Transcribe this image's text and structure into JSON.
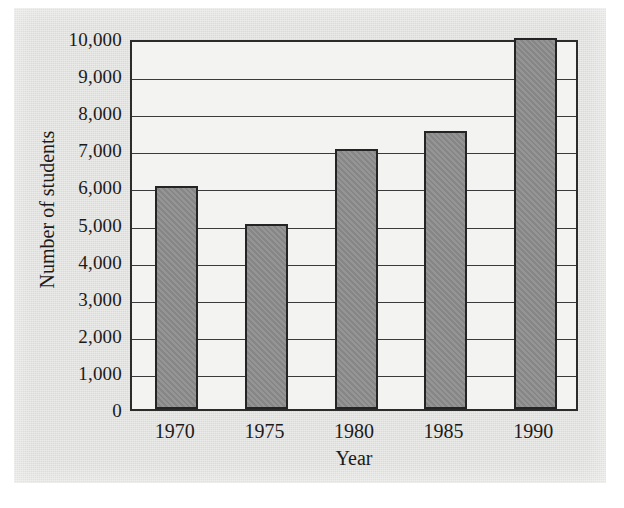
{
  "chart_data": {
    "type": "bar",
    "title": "",
    "xlabel": "Year",
    "ylabel": "Number of students",
    "categories": [
      "1970",
      "1975",
      "1980",
      "1985",
      "1990"
    ],
    "values": [
      6000,
      5000,
      7000,
      7500,
      10000
    ],
    "ylim": [
      0,
      10000
    ],
    "ytick_labels": [
      "10,000",
      "9,000",
      "8,000",
      "7,000",
      "6,000",
      "5,000",
      "4,000",
      "3,000",
      "2,000",
      "1,000",
      "0"
    ],
    "ytick_values": [
      10000,
      9000,
      8000,
      7000,
      6000,
      5000,
      4000,
      3000,
      2000,
      1000,
      0
    ],
    "grid": true,
    "grid_axis": "y",
    "legend": "none",
    "series": [
      {
        "name": "Number of students",
        "values": [
          6000,
          5000,
          7000,
          7500,
          10000
        ]
      }
    ]
  },
  "style": {
    "bar_fill": "#8d8d8d",
    "bar_edge": "#242424",
    "plot_background": "#f3f3f1",
    "paper_background": "#e0e0dd",
    "axis_color": "#2b2b2b",
    "grid_color": "#3a3a3a",
    "text_color": "#1b1b1b"
  }
}
